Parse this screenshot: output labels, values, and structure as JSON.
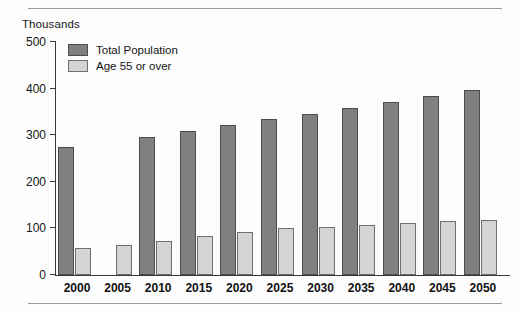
{
  "figure": {
    "units_caption": "Thousands",
    "has_top_rule": true,
    "has_bottom_rule": true
  },
  "colors": {
    "total_population": "#808080",
    "age_55_or_over": "#d4d4d4",
    "axis": "#3a3a3a",
    "rule": "#9a9a9a",
    "text": "#161616",
    "background": "#fdfdfd"
  },
  "legend": {
    "position": "top-left-inside",
    "entries": [
      {
        "label": "Total Population",
        "swatch": "total"
      },
      {
        "label": "Age 55 or over",
        "swatch": "senior"
      }
    ]
  },
  "chart_data": {
    "type": "bar",
    "title": "",
    "subtitle": "",
    "xlabel": "",
    "ylabel": "Thousands",
    "ylim": [
      0,
      500
    ],
    "yticks": [
      0,
      100,
      200,
      300,
      400,
      500
    ],
    "ytick_labels": [
      "0",
      "100",
      "200",
      "300",
      "400",
      "500"
    ],
    "grid": false,
    "legend_position": "upper left",
    "categories": [
      "2000",
      "2005",
      "2010",
      "2015",
      "2020",
      "2025",
      "2030",
      "2035",
      "2040",
      "2045",
      "2050"
    ],
    "series": [
      {
        "name": "Total Population",
        "values": [
          275,
          null,
          297,
          310,
          322,
          334,
          346,
          359,
          371,
          384,
          397
        ]
      },
      {
        "name": "Age 55 or over",
        "values": [
          58,
          65,
          73,
          83,
          93,
          100,
          104,
          107,
          111,
          115,
          119
        ]
      }
    ]
  }
}
